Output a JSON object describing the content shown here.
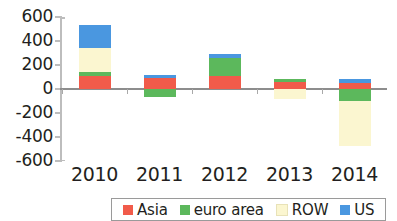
{
  "chart_data": {
    "type": "bar",
    "stacked": true,
    "title": "",
    "subtitle": "",
    "xlabel": "",
    "ylabel": "",
    "categories": [
      "2010",
      "2011",
      "2012",
      "2013",
      "2014"
    ],
    "ylim": [
      -600,
      600
    ],
    "yticks": [
      600,
      400,
      200,
      0,
      -200,
      -400,
      -600
    ],
    "ytick_labels": [
      "600",
      "400",
      "200",
      "0",
      "-200",
      "-400",
      "-600"
    ],
    "grid": false,
    "legend_position": "bottom",
    "series": [
      {
        "name": "Asia",
        "color": "#f15b4a",
        "values": [
          108,
          92,
          108,
          58,
          50
        ]
      },
      {
        "name": "euro area",
        "color": "#5cb85c",
        "values": [
          33,
          -67,
          150,
          25,
          -100
        ]
      },
      {
        "name": "ROW",
        "color": "#fbf6d0",
        "values": [
          200,
          0,
          0,
          -83,
          -375
        ]
      },
      {
        "name": "US",
        "color": "#4a97e0",
        "values": [
          192,
          25,
          33,
          0,
          33
        ]
      }
    ],
    "totals_positive": [
      533,
      117,
      291,
      83,
      83
    ],
    "totals_negative": [
      0,
      -67,
      0,
      -83,
      -475
    ]
  },
  "axis": {
    "y_labels": [
      "600",
      "400",
      "200",
      "0",
      "-200",
      "-400",
      "-600"
    ],
    "x_labels": [
      "2010",
      "2011",
      "2012",
      "2013",
      "2014"
    ]
  },
  "legend": {
    "items": [
      {
        "label": "Asia",
        "color": "#f15b4a"
      },
      {
        "label": "euro area",
        "color": "#5cb85c"
      },
      {
        "label": "ROW",
        "color": "#fbf6d0"
      },
      {
        "label": "US",
        "color": "#4a97e0"
      }
    ]
  }
}
